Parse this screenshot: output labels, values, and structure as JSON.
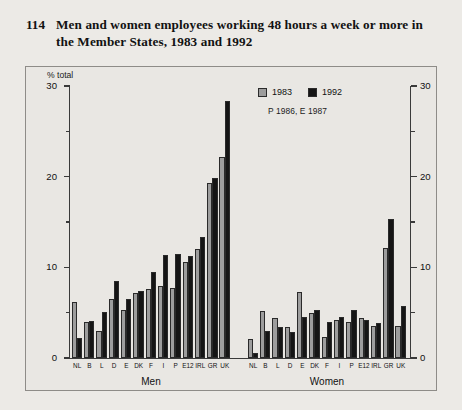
{
  "title": {
    "number": "114",
    "text": "Men and women employees working 48 hours a week or more in the Member States, 1983 and 1992"
  },
  "legend": {
    "series1_label": "1983",
    "series2_label": "1992",
    "note": "P 1986, E 1987",
    "series1_color": "#9d9d9d",
    "series2_color": "#151515"
  },
  "axis": {
    "unit_label": "% total",
    "ticks": [
      "0",
      "10",
      "20",
      "30"
    ],
    "minor_ticks": [
      "5",
      "15",
      "25"
    ]
  },
  "panels": [
    {
      "label": "Men"
    },
    {
      "label": "Women"
    }
  ],
  "chart_data": {
    "type": "bar",
    "title": "Men and women employees working 48 hours a week or more in the Member States, 1983 and 1992",
    "xlabel": "",
    "ylabel": "% total",
    "ylim": [
      0,
      30
    ],
    "yticks": [
      0,
      10,
      20,
      30
    ],
    "grid": false,
    "legend_position": "top-right",
    "note": "P 1986, E 1987",
    "panels": [
      {
        "name": "Men",
        "categories": [
          "NL",
          "B",
          "L",
          "D",
          "E",
          "DK",
          "F",
          "I",
          "P",
          "E12",
          "IRL",
          "GR",
          "UK"
        ],
        "series": [
          {
            "name": "1983",
            "values": [
              6.2,
              4.0,
              3.0,
              6.5,
              5.3,
              7.2,
              7.6,
              7.9,
              7.7,
              10.6,
              12.0,
              19.3,
              22.2
            ]
          },
          {
            "name": "1992",
            "values": [
              2.2,
              4.1,
              5.1,
              8.5,
              6.5,
              7.4,
              9.5,
              11.4,
              11.5,
              11.2,
              13.3,
              19.8,
              28.3
            ]
          }
        ]
      },
      {
        "name": "Women",
        "categories": [
          "NL",
          "B",
          "L",
          "D",
          "E",
          "DK",
          "F",
          "I",
          "P",
          "E12",
          "IRL",
          "GR",
          "UK"
        ],
        "series": [
          {
            "name": "1983",
            "values": [
              2.1,
              5.2,
              4.4,
              3.4,
              7.3,
              5.0,
              2.3,
              4.2,
              4.0,
              4.4,
              3.5,
              12.1,
              3.5
            ]
          },
          {
            "name": "1992",
            "values": [
              0.5,
              3.0,
              3.4,
              2.9,
              4.5,
              5.3,
              4.0,
              4.5,
              5.3,
              4.2,
              3.9,
              15.3,
              5.7
            ]
          }
        ]
      }
    ]
  }
}
